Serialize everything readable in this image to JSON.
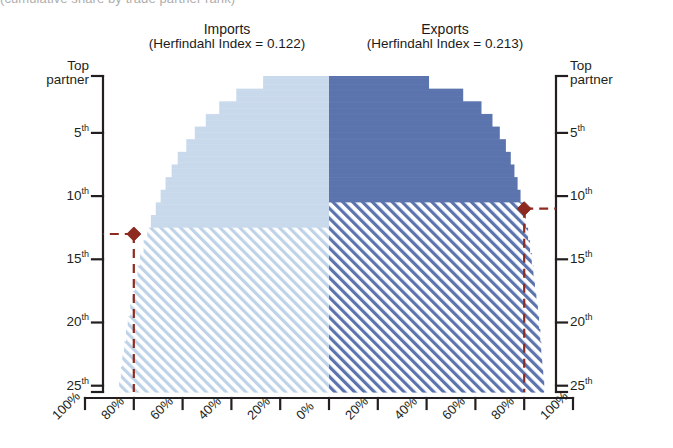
{
  "caption_fragment": "(cumulative share by trade partner rank)",
  "panels": {
    "imports": {
      "title": "Imports",
      "subtitle": "(Herfindahl Index = 0.122)",
      "index_label": "Herfindahl Index",
      "index_value": "0.122",
      "fill_color": "#c9d9ec",
      "hatch_color": "#b8cde3"
    },
    "exports": {
      "title": "Exports",
      "subtitle": "(Herfindahl Index = 0.213)",
      "index_label": "Herfindahl Index",
      "index_value": "0.213",
      "fill_color": "#5b74ae",
      "hatch_color": "#5b74ae"
    }
  },
  "axes": {
    "y_left_title": "Top\npartner",
    "y_left": [
      {
        "label": "Top",
        "label2": "partner",
        "sup": "",
        "rank": 1
      },
      {
        "label": "5",
        "sup": "th",
        "rank": 5
      },
      {
        "label": "10",
        "sup": "th",
        "rank": 10
      },
      {
        "label": "15",
        "sup": "th",
        "rank": 15
      },
      {
        "label": "20",
        "sup": "th",
        "rank": 20
      },
      {
        "label": "25",
        "sup": "th",
        "rank": 25
      }
    ],
    "y_right": [
      {
        "label": "Top",
        "label2": "partner",
        "sup": "",
        "rank": 1
      },
      {
        "label": "5",
        "sup": "th",
        "rank": 5
      },
      {
        "label": "10",
        "sup": "th",
        "rank": 10
      },
      {
        "label": "15",
        "sup": "th",
        "rank": 15
      },
      {
        "label": "20",
        "sup": "th",
        "rank": 20
      },
      {
        "label": "25",
        "sup": "th",
        "rank": 25
      }
    ],
    "x_labels": [
      "100%",
      "80%",
      "60%",
      "40%",
      "20%",
      "0%",
      "20%",
      "40%",
      "60%",
      "80%",
      "100%"
    ]
  },
  "markers": {
    "color": "#8e2a1f",
    "line_style": "dashed",
    "imports_marker": {
      "share": "80%",
      "rank": "13th"
    },
    "exports_marker": {
      "share": "80%",
      "rank": "11th"
    }
  },
  "chart_data": {
    "type": "bar",
    "subtitle": "(cumulative share by trade partner rank)",
    "orientation": "horizontal-mirrored",
    "xlabel": "",
    "ylabel": "Partner rank",
    "xlim": [
      -100,
      100
    ],
    "ylim": [
      1,
      26
    ],
    "grid": false,
    "legend": "none",
    "categories": [
      "Top partner",
      "2nd",
      "3rd",
      "4th",
      "5th",
      "6th",
      "7th",
      "8th",
      "9th",
      "10th",
      "11th",
      "12th",
      "13th",
      "14th",
      "15th",
      "16th",
      "17th",
      "18th",
      "19th",
      "20th",
      "21st",
      "22nd",
      "23rd",
      "24th",
      "25th"
    ],
    "series": [
      {
        "name": "Imports",
        "direction": "left",
        "herfindahl_index": 0.122,
        "values": [
          27.0,
          38.0,
          45.0,
          50.5,
          55.0,
          58.5,
          62.0,
          64.5,
          67.0,
          69.0,
          71.0,
          73.0,
          74.5,
          76.0,
          77.5,
          78.5,
          79.5,
          80.5,
          81.5,
          82.5,
          83.2,
          84.0,
          84.7,
          85.3,
          86.0
        ]
      },
      {
        "name": "Exports",
        "direction": "right",
        "herfindahl_index": 0.213,
        "values": [
          41.0,
          55.0,
          62.5,
          67.0,
          70.0,
          72.5,
          74.5,
          76.0,
          77.3,
          78.5,
          79.7,
          80.7,
          81.6,
          82.4,
          83.1,
          83.8,
          84.4,
          85.0,
          85.6,
          86.1,
          86.6,
          87.0,
          87.4,
          87.8,
          88.2
        ]
      }
    ],
    "annotations": [
      {
        "text": "Imports 80% reached at ~13th partner",
        "x": -80,
        "y": 13
      },
      {
        "text": "Exports 80% reached at ~11th partner",
        "x": 80,
        "y": 11
      }
    ]
  }
}
